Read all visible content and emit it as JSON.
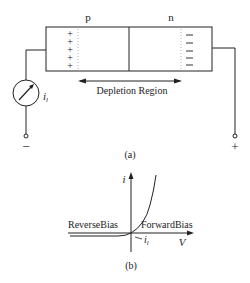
{
  "figure_a": {
    "label_p": "p",
    "label_n": "n",
    "plus_sign": "+",
    "minus_sign": "−",
    "depletion_label": "Depletion Region",
    "meter_current_label": "i",
    "meter_current_subscript": "l",
    "terminal_left": "−",
    "terminal_right": "+",
    "caption": "(a)",
    "icons": {
      "meter": "ammeter-icon",
      "arrow": "double-arrow-icon"
    }
  },
  "figure_b": {
    "y_axis_label": "i",
    "x_axis_label": "V",
    "reverse_label": "ReverseBias",
    "forward_label": "ForwardBias",
    "leakage_label": "i",
    "leakage_subscript": "l",
    "caption": "(b)"
  },
  "colors": {
    "line": "#222222",
    "background": "#ffffff",
    "dotted": "#999999"
  }
}
